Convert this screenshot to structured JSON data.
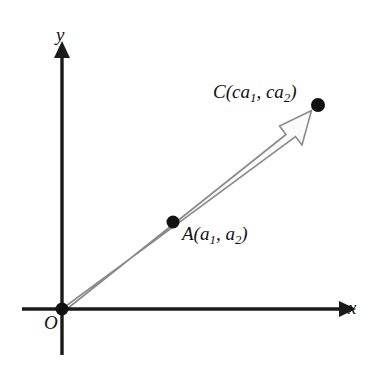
{
  "figure": {
    "background_color": "#ffffff"
  },
  "axes": {
    "x_label": "x",
    "y_label": "y",
    "origin_label": "O",
    "color": "#1a1a1a",
    "x_axis": {
      "x_start": 22,
      "x_end": 345,
      "y": 309
    },
    "y_axis": {
      "y_start": 52,
      "y_end": 355,
      "x": 62
    }
  },
  "vector": {
    "name": "OC",
    "style": "hollow-outlined-arrow",
    "stroke_color": "#8a8a8a",
    "fill_color": "#fbfbfb",
    "from": {
      "x": 62,
      "y": 309
    },
    "to": {
      "x": 312,
      "y": 110
    }
  },
  "points": [
    {
      "id": "O",
      "label": "O",
      "label_html": "O",
      "x": 62,
      "y": 309,
      "dot_color": "#111111",
      "dot_radius": 6
    },
    {
      "id": "A",
      "label": "A(a1, a2)",
      "label_html": "A(a<sub>1</sub>, a<sub>2</sub>)",
      "x": 173,
      "y": 222,
      "dot_color": "#111111",
      "dot_radius": 6
    },
    {
      "id": "C",
      "label": "C(ca1, ca2)",
      "label_html": "C(ca<sub>1</sub>, ca<sub>2</sub>)",
      "x": 318,
      "y": 105,
      "dot_color": "#111111",
      "dot_radius": 7
    }
  ]
}
